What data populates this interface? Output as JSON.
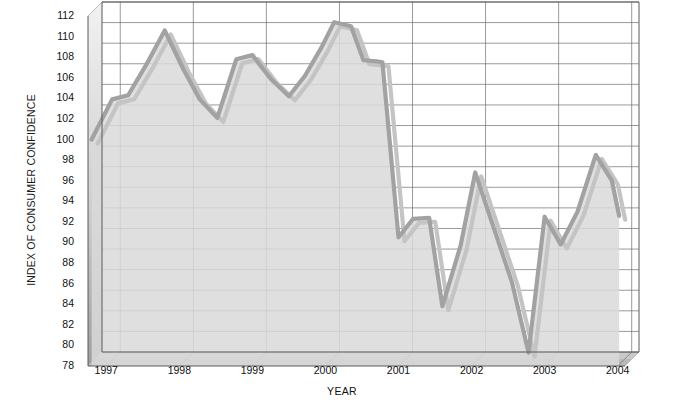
{
  "chart_data": {
    "type": "area",
    "title": "",
    "xlabel": "YEAR",
    "ylabel": "INDEX OF CONSUMER CONFIDENCE",
    "ylim": [
      78,
      112
    ],
    "xlim": [
      1996.75,
      2004.1
    ],
    "grid": true,
    "legend": null,
    "ytick_labels": [
      "112",
      "110",
      "108",
      "106",
      "104",
      "102",
      "100",
      "98",
      "96",
      "94",
      "92",
      "90",
      "88",
      "86",
      "84",
      "82",
      "80",
      "78"
    ],
    "ytick_values": [
      112,
      110,
      108,
      106,
      104,
      102,
      100,
      98,
      96,
      94,
      92,
      90,
      88,
      86,
      84,
      82,
      80,
      78
    ],
    "xtick_labels": [
      "1997",
      "1998",
      "1999",
      "2000",
      "2001",
      "2002",
      "2003",
      "2004"
    ],
    "xtick_values": [
      1997,
      1998,
      1999,
      2000,
      2001,
      2002,
      2003,
      2004
    ],
    "series": [
      {
        "name": "Index of Consumer Confidence",
        "color": "#a2a2a2",
        "x": [
          1996.8,
          1997.08,
          1997.3,
          1997.55,
          1997.8,
          1998.05,
          1998.28,
          1998.52,
          1998.78,
          1999.0,
          1999.25,
          1999.5,
          1999.72,
          1999.95,
          2000.12,
          2000.35,
          2000.52,
          2000.7,
          2000.78,
          2001.0,
          2001.2,
          2001.42,
          2001.6,
          2001.85,
          2002.05,
          2002.3,
          2002.55,
          2002.78,
          2003.0,
          2003.22,
          2003.45,
          2003.7,
          2003.92,
          2004.02
        ],
        "y": [
          100.0,
          103.9,
          104.3,
          107.3,
          110.6,
          106.9,
          103.9,
          102.1,
          107.8,
          108.2,
          105.9,
          104.2,
          106.2,
          109.0,
          111.4,
          111.0,
          107.7,
          107.6,
          107.5,
          90.5,
          92.3,
          92.4,
          83.8,
          89.7,
          96.8,
          91.5,
          86.2,
          79.3,
          92.5,
          89.8,
          93.0,
          98.5,
          96.0,
          92.6
        ]
      }
    ]
  },
  "axes": {
    "y_title": "INDEX OF CONSUMER CONFIDENCE",
    "x_title": "YEAR"
  }
}
